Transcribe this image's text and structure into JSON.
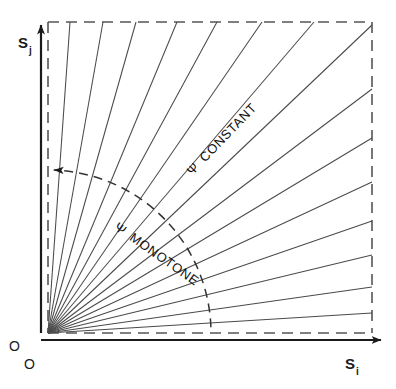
{
  "figure": {
    "background_color": "#ffffff",
    "line_color": "#4a4a4a",
    "axis_color": "#1a1a1a",
    "dash_color": "#555555"
  },
  "axes": {
    "y_axis": {
      "symbol": "S",
      "subscript": "j",
      "name": "vertical-axis"
    },
    "x_axis": {
      "symbol": "S",
      "subscript": "i",
      "name": "horizontal-axis"
    },
    "origin_label_left": "O",
    "origin_label_below": "O"
  },
  "annotations": {
    "constant": {
      "psi": "Ψ",
      "text": "CONSTANT"
    },
    "monotone": {
      "psi": "Ψ",
      "text": "MONOTONE"
    }
  },
  "chart_data": {
    "type": "line",
    "title": "",
    "xlabel": "S_i",
    "ylabel": "S_j",
    "origin": [
      48,
      333
    ],
    "plot_box": {
      "left": 48,
      "top": 22,
      "right": 372,
      "bottom": 333,
      "border": "dashed"
    },
    "rays": [
      {
        "id": 1,
        "angle_deg": 86.0,
        "endpoint": [
          70,
          22
        ]
      },
      {
        "id": 2,
        "angle_deg": 80.0,
        "endpoint": [
          103,
          22
        ]
      },
      {
        "id": 3,
        "angle_deg": 73.5,
        "endpoint": [
          136,
          22
        ]
      },
      {
        "id": 4,
        "angle_deg": 67.5,
        "endpoint": [
          177,
          22
        ]
      },
      {
        "id": 5,
        "angle_deg": 61.5,
        "endpoint": [
          217,
          22
        ]
      },
      {
        "id": 6,
        "angle_deg": 55.5,
        "endpoint": [
          262,
          22
        ]
      },
      {
        "id": 7,
        "angle_deg": 49.5,
        "endpoint": [
          314,
          22
        ]
      },
      {
        "id": 8,
        "angle_deg": 43.5,
        "endpoint": [
          372,
          25
        ]
      },
      {
        "id": 9,
        "angle_deg": 37.0,
        "endpoint": [
          372,
          89
        ]
      },
      {
        "id": 10,
        "angle_deg": 31.0,
        "endpoint": [
          372,
          138
        ]
      },
      {
        "id": 11,
        "angle_deg": 25.0,
        "endpoint": [
          372,
          182
        ]
      },
      {
        "id": 12,
        "angle_deg": 19.0,
        "endpoint": [
          372,
          221
        ]
      },
      {
        "id": 13,
        "angle_deg": 13.5,
        "endpoint": [
          372,
          255
        ]
      },
      {
        "id": 14,
        "angle_deg": 8.0,
        "endpoint": [
          372,
          287
        ]
      },
      {
        "id": 15,
        "angle_deg": 3.5,
        "endpoint": [
          372,
          313
        ]
      }
    ],
    "monotone_arc": {
      "center": [
        48,
        333
      ],
      "radius": 163,
      "start_angle_deg": 2,
      "end_angle_deg": 88,
      "style": "dashed",
      "arrowhead_at": "end_angle",
      "direction": "counterclockwise"
    },
    "constant_label_angle_deg": 46,
    "grid": false,
    "legend": "none"
  }
}
